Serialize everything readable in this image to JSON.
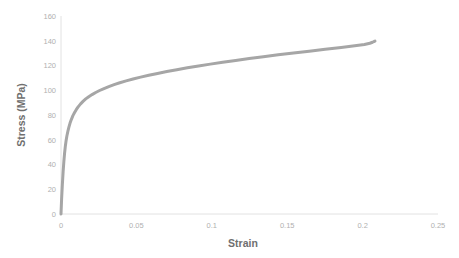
{
  "chart_data": {
    "type": "line",
    "title": "",
    "xlabel": "Strain",
    "ylabel": "Stress (MPa)",
    "xlim": [
      0,
      0.25
    ],
    "ylim": [
      0,
      160
    ],
    "xticks": [
      "0",
      "0.05",
      "0.1",
      "0.15",
      "0.2",
      "0.25"
    ],
    "xtick_values": [
      0,
      0.05,
      0.1,
      0.15,
      0.2,
      0.25
    ],
    "yticks": [
      "0",
      "20",
      "40",
      "60",
      "80",
      "100",
      "120",
      "140",
      "160"
    ],
    "ytick_values": [
      0,
      20,
      40,
      60,
      80,
      100,
      120,
      140,
      160
    ],
    "grid": false,
    "legend": "none",
    "series": [
      {
        "name": "Stress-Strain Curve",
        "color": "#a6a6a6",
        "linewidth": 3,
        "x": [
          0,
          0.0004,
          0.0009,
          0.0014,
          0.0019,
          0.0024,
          0.0029,
          0.0034,
          0.0039,
          0.0045,
          0.0052,
          0.006,
          0.0069,
          0.0079,
          0.009,
          0.0102,
          0.0115,
          0.013,
          0.0146,
          0.0164,
          0.0184,
          0.0206,
          0.023,
          0.0256,
          0.0285,
          0.0317,
          0.0352,
          0.039,
          0.0432,
          0.0478,
          0.0528,
          0.0582,
          0.064,
          0.0702,
          0.0768,
          0.0838,
          0.0912,
          0.099,
          0.1072,
          0.1158,
          0.1248,
          0.1342,
          0.144,
          0.1542,
          0.1646,
          0.1752,
          0.1858,
          0.1948,
          0.2012,
          0.2048,
          0.2066,
          0.2076,
          0.2082
        ],
        "y": [
          0,
          12,
          24,
          34,
          42.5,
          49.5,
          55,
          59.5,
          63,
          66.5,
          70,
          73.5,
          76.5,
          79.5,
          82,
          84.5,
          86.8,
          89,
          91,
          93,
          94.8,
          96.5,
          98.2,
          99.8,
          101.4,
          103,
          104.6,
          106.1,
          107.6,
          109.1,
          110.6,
          112.1,
          113.6,
          115.1,
          116.6,
          118.1,
          119.6,
          121.1,
          122.6,
          124.1,
          125.6,
          127.1,
          128.6,
          130.1,
          131.6,
          133.1,
          134.6,
          135.9,
          137.0,
          138.0,
          138.8,
          139.4,
          139.7
        ]
      }
    ]
  },
  "axes": {
    "axis_line_color": "#d9d9d9",
    "tick_label_color": "#b0b0b0",
    "axis_title_color": "#6f6f6f"
  }
}
